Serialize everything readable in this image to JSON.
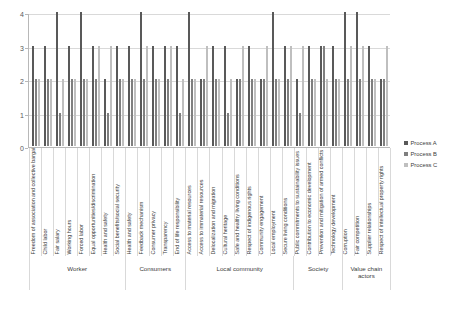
{
  "chart_data": {
    "type": "bar",
    "title": "",
    "xlabel": "",
    "ylabel": "",
    "ylim": [
      0,
      4
    ],
    "yticks": [
      0,
      1,
      2,
      3,
      4
    ],
    "grid": true,
    "legend_position": "right",
    "categories": [
      "Freedom of association and collective bargaining",
      "Child labor",
      "Fair salary",
      "Working hours",
      "Forced labor",
      "Equal opportunities/discrimination",
      "Health and safety",
      "Social benefits/social security",
      "Health and safety",
      "Feedback mechanism",
      "Consumer privacy",
      "Transparency",
      "End of life responsibility",
      "Access to material resources",
      "Access to immaterial resources",
      "Delocalization and migration",
      "Cultural heritage",
      "Safe and healthy living conditions",
      "Respect of indigenous rights",
      "Community engagement",
      "Local employment",
      "Secure living conditions",
      "Public commitments to sustainability issues",
      "Contribution to economic development",
      "Prevention and mitigation of armed conflicts",
      "Technology development",
      "Corruption",
      "Fair competition",
      "Supplier relationships",
      "Respect of intellectual property rights"
    ],
    "series": [
      {
        "name": "Process A",
        "color": "#595959",
        "values": [
          3,
          3,
          4,
          3,
          4,
          3,
          2,
          3,
          3,
          4,
          3,
          3,
          3,
          4,
          2,
          3,
          3,
          2,
          3,
          2,
          4,
          3,
          2,
          3,
          3,
          3,
          4,
          4,
          3,
          2
        ]
      },
      {
        "name": "Process B",
        "color": "#7f7f7f",
        "values": [
          2,
          2,
          1,
          2,
          2,
          2,
          1,
          2,
          2,
          2,
          2,
          2,
          1,
          2,
          2,
          2,
          1,
          2,
          2,
          2,
          2,
          2,
          1,
          2,
          3,
          2,
          2,
          2,
          2,
          2
        ]
      },
      {
        "name": "Process C",
        "color": "#bfbfbf",
        "values": [
          2,
          2,
          2,
          2,
          2,
          3,
          3,
          2,
          2,
          3,
          2,
          3,
          2,
          2,
          3,
          2,
          2,
          3,
          2,
          3,
          2,
          3,
          3,
          2,
          2,
          2,
          3,
          3,
          2,
          3
        ]
      }
    ],
    "groups": [
      {
        "label": "Worker",
        "span": 8
      },
      {
        "label": "Consumers",
        "span": 5
      },
      {
        "label": "Local community",
        "span": 9
      },
      {
        "label": "Society",
        "span": 4
      },
      {
        "label": "Value chain actors",
        "span": 4
      }
    ]
  },
  "legend": {
    "items": [
      {
        "label": "Process A",
        "key": "a"
      },
      {
        "label": "Process B",
        "key": "b"
      },
      {
        "label": "Process C",
        "key": "c"
      }
    ]
  }
}
